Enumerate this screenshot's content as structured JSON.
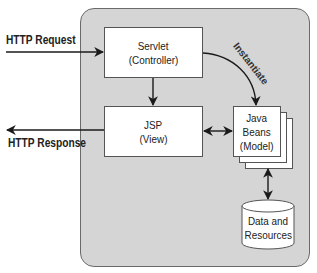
{
  "diagram": {
    "type": "MVC architecture (JSP Model 2)",
    "external": {
      "request_label": "HTTP Request",
      "response_label": "HTTP Response"
    },
    "nodes": {
      "servlet": {
        "line1": "Servlet",
        "line2": "(Controller)"
      },
      "jsp": {
        "line1": "JSP",
        "line2": "(View)"
      },
      "beans": {
        "line1": "Java",
        "line2": "Beans",
        "line3": "(Model)"
      },
      "data": {
        "line1": "Data and",
        "line2": "Resources"
      }
    },
    "edges": [
      {
        "from": "HTTP Request",
        "to": "Servlet (Controller)",
        "direction": "one-way"
      },
      {
        "from": "Servlet (Controller)",
        "to": "JSP (View)",
        "direction": "one-way"
      },
      {
        "from": "Servlet (Controller)",
        "to": "Java Beans (Model)",
        "direction": "one-way",
        "label": "Instantiate"
      },
      {
        "from": "JSP (View)",
        "to": "Java Beans (Model)",
        "direction": "two-way"
      },
      {
        "from": "Java Beans (Model)",
        "to": "Data and Resources",
        "direction": "two-way"
      },
      {
        "from": "JSP (View)",
        "to": "HTTP Response",
        "direction": "one-way"
      }
    ],
    "instantiate_label": "Instantiate",
    "colors": {
      "panel": "#d5d5d5",
      "box": "#ffffff",
      "line": "#1a1a1a"
    }
  }
}
